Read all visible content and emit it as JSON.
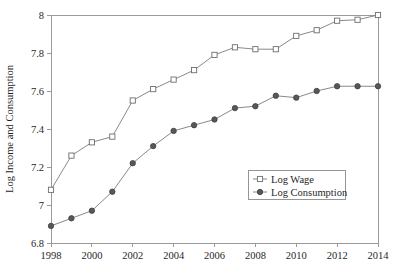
{
  "chart_data": {
    "type": "line",
    "title": "",
    "xlabel": "",
    "ylabel": "Log Income and Consumption",
    "xlim": [
      1998,
      2014
    ],
    "ylim": [
      6.8,
      8.0
    ],
    "grid": false,
    "legend_position": "center-right",
    "x": [
      1998,
      1999,
      2000,
      2001,
      2002,
      2003,
      2004,
      2005,
      2006,
      2007,
      2008,
      2009,
      2010,
      2011,
      2012,
      2013,
      2014
    ],
    "xticks": [
      1998,
      2000,
      2002,
      2004,
      2006,
      2008,
      2010,
      2012,
      2014
    ],
    "xtick_labels": [
      "1998",
      "2000",
      "2002",
      "2004",
      "2006",
      "2008",
      "2010",
      "2012",
      "2014"
    ],
    "yticks": [
      6.8,
      7.0,
      7.2,
      7.4,
      7.6,
      7.8,
      8.0
    ],
    "ytick_labels": [
      "6.8",
      "7",
      "7.2",
      "7.4",
      "7.6",
      "7.8",
      "8"
    ],
    "series": [
      {
        "name": "Log Wage",
        "marker": "open-square",
        "color": "#6e6e6e",
        "values": [
          7.08,
          7.26,
          7.33,
          7.36,
          7.55,
          7.61,
          7.66,
          7.71,
          7.79,
          7.83,
          7.82,
          7.82,
          7.89,
          7.92,
          7.97,
          7.975,
          8.0
        ]
      },
      {
        "name": "Log Consumption",
        "marker": "filled-circle",
        "color": "#585858",
        "values": [
          6.89,
          6.93,
          6.97,
          7.07,
          7.22,
          7.31,
          7.39,
          7.42,
          7.45,
          7.51,
          7.52,
          7.575,
          7.565,
          7.6,
          7.625,
          7.625,
          7.625
        ]
      }
    ]
  },
  "legend": {
    "entries": [
      {
        "label": "Log Wage"
      },
      {
        "label": "Log Consumption"
      }
    ]
  },
  "axes": {
    "y_axis_title": "Log Income and Consumption"
  }
}
